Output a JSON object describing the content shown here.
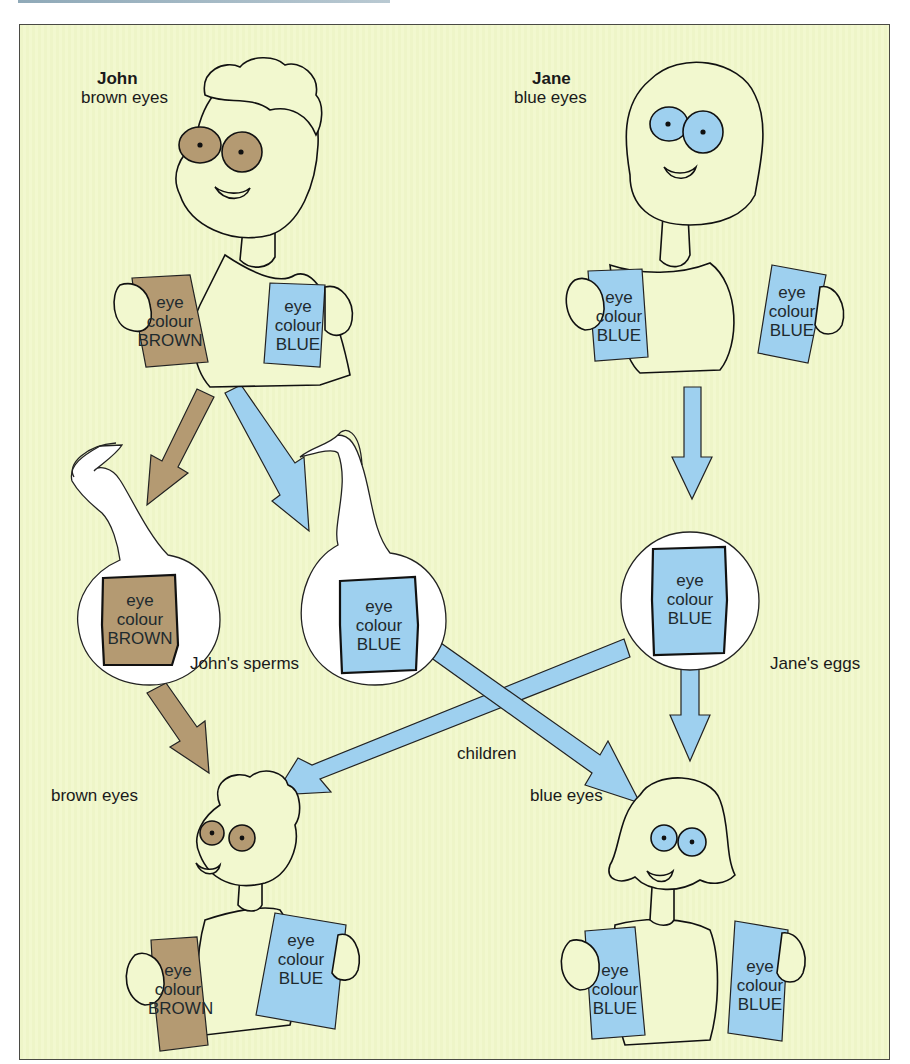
{
  "colors": {
    "background": "#f2f8cf",
    "brown": "#b49a72",
    "blue": "#9ed0ef",
    "outline": "#111111",
    "frame": "#4a4a44"
  },
  "parents": {
    "john": {
      "name": "John",
      "trait": "brown eyes",
      "cards": [
        {
          "line1": "eye",
          "line2": "colour",
          "line3": "BROWN",
          "color": "brown"
        },
        {
          "line1": "eye",
          "line2": "colour",
          "line3": "BLUE",
          "color": "blue"
        }
      ]
    },
    "jane": {
      "name": "Jane",
      "trait": "blue eyes",
      "cards": [
        {
          "line1": "eye",
          "line2": "colour",
          "line3": "BLUE",
          "color": "blue"
        },
        {
          "line1": "eye",
          "line2": "colour",
          "line3": "BLUE",
          "color": "blue"
        }
      ]
    }
  },
  "gametes": {
    "sperms_label": "John's sperms",
    "eggs_label": "Jane's eggs",
    "sperm_brown": {
      "line1": "eye",
      "line2": "colour",
      "line3": "BROWN"
    },
    "sperm_blue": {
      "line1": "eye",
      "line2": "colour",
      "line3": "BLUE"
    },
    "egg_blue": {
      "line1": "eye",
      "line2": "colour",
      "line3": "BLUE"
    }
  },
  "children": {
    "label": "children",
    "child1": {
      "trait": "brown eyes",
      "cards": [
        {
          "line1": "eye",
          "line2": "colour",
          "line3": "BROWN",
          "color": "brown"
        },
        {
          "line1": "eye",
          "line2": "colour",
          "line3": "BLUE",
          "color": "blue"
        }
      ]
    },
    "child2": {
      "trait": "blue eyes",
      "cards": [
        {
          "line1": "eye",
          "line2": "colour",
          "line3": "BLUE",
          "color": "blue"
        },
        {
          "line1": "eye",
          "line2": "colour",
          "line3": "BLUE",
          "color": "blue"
        }
      ]
    }
  }
}
